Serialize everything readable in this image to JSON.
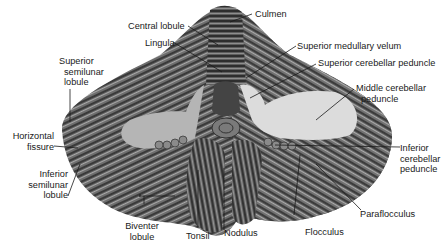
{
  "figure": {
    "labels": {
      "culmen": "Culmen",
      "central_lobule": "Central lobule",
      "lingula": "Lingula",
      "superior_medullary_velum": "Superior medullary velum",
      "superior_cerebellar_peduncle": "Superior cerebellar peduncle",
      "middle_cerebellar_peduncle": [
        "Middle cerebellar",
        "peduncle"
      ],
      "superior_semilunar_lobule": [
        "Superior",
        "semilunar",
        "lobule"
      ],
      "horizontal_fissure": [
        "Horizontal",
        "fissure"
      ],
      "inferior_semilunar_lobule": [
        "Inferior",
        "semilunar",
        "lobule"
      ],
      "inferior_cerebellar_peduncle": [
        "Inferior",
        "cerebellar",
        "peduncle"
      ],
      "biventer_lobule": [
        "Biventer",
        "lobule"
      ],
      "tonsil": "Tonsil",
      "nodulus": "Nodulus",
      "flocculus": "Flocculus",
      "paraflocculus": "Paraflocculus"
    }
  }
}
